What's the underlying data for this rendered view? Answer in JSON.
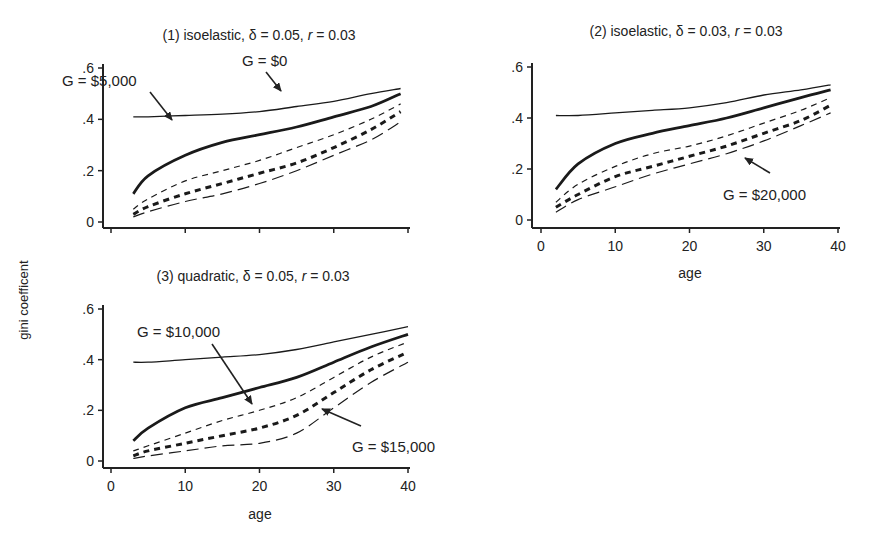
{
  "figure": {
    "y_axis_label": "gini coefficent",
    "x_axis_label": "age",
    "caption": ""
  },
  "chart_data": [
    {
      "type": "line",
      "panel": 1,
      "title": "(1) isoelastic, δ = 0.05, r = 0.03",
      "title_parts": {
        "prefix": "(1) isoelastic, δ = 0.05, ",
        "r": "r",
        "suffix": " = 0.03"
      },
      "xlabel": "",
      "ylabel": "gini coefficent",
      "xlim": [
        0,
        40
      ],
      "ylim": [
        0,
        0.6
      ],
      "x_ticks": [
        0,
        10,
        20,
        30,
        40
      ],
      "x_tick_labels_visible": false,
      "y_ticks": [
        0,
        0.2,
        0.4,
        0.6
      ],
      "y_tick_labels": [
        "0",
        ".2",
        ".4",
        ".6"
      ],
      "grid": false,
      "x": [
        3,
        5,
        10,
        15,
        20,
        25,
        30,
        35,
        39
      ],
      "series": [
        {
          "name": "G = $0",
          "style": "thin-solid",
          "values": [
            0.41,
            0.41,
            0.415,
            0.42,
            0.43,
            0.45,
            0.47,
            0.5,
            0.52
          ]
        },
        {
          "name": "G = $5,000",
          "style": "thick-solid",
          "values": [
            0.11,
            0.18,
            0.26,
            0.31,
            0.34,
            0.37,
            0.41,
            0.45,
            0.5
          ]
        },
        {
          "name": "G = $10,000",
          "style": "thin-dash",
          "values": [
            0.05,
            0.09,
            0.16,
            0.2,
            0.24,
            0.29,
            0.34,
            0.4,
            0.46
          ]
        },
        {
          "name": "G = $15,000",
          "style": "thick-dash",
          "values": [
            0.03,
            0.06,
            0.11,
            0.15,
            0.19,
            0.23,
            0.29,
            0.36,
            0.43
          ]
        },
        {
          "name": "G = $20,000",
          "style": "long-dash",
          "values": [
            0.02,
            0.04,
            0.08,
            0.11,
            0.15,
            0.2,
            0.26,
            0.32,
            0.39
          ]
        }
      ],
      "annotations": [
        {
          "text": "G = $5,000",
          "tx": 62,
          "ty": 86,
          "arrow_from": [
            150,
            92
          ],
          "arrow_to": [
            172,
            120
          ]
        },
        {
          "text": "G = $0",
          "tx": 242,
          "ty": 66,
          "arrow_from": [
            266,
            72
          ],
          "arrow_to": [
            281,
            91
          ]
        }
      ]
    },
    {
      "type": "line",
      "panel": 2,
      "title": "(2) isoelastic, δ = 0.03, r = 0.03",
      "title_parts": {
        "prefix": "(2) isoelastic, δ = 0.03, ",
        "r": "r",
        "suffix": " = 0.03"
      },
      "xlabel": "age",
      "ylabel": "",
      "xlim": [
        0,
        40
      ],
      "ylim": [
        0,
        0.6
      ],
      "x_ticks": [
        0,
        10,
        20,
        30,
        40
      ],
      "x_tick_labels_visible": true,
      "x_tick_labels": [
        "0",
        "10",
        "20",
        "30",
        "40"
      ],
      "y_ticks": [
        0,
        0.2,
        0.4,
        0.6
      ],
      "y_tick_labels": [
        "0",
        ".2",
        ".4",
        ".6"
      ],
      "grid": false,
      "x": [
        2,
        5,
        10,
        15,
        20,
        25,
        30,
        35,
        39
      ],
      "series": [
        {
          "name": "G = $0",
          "style": "thin-solid",
          "values": [
            0.41,
            0.41,
            0.42,
            0.43,
            0.44,
            0.46,
            0.49,
            0.51,
            0.53
          ]
        },
        {
          "name": "G = $5,000",
          "style": "thick-solid",
          "values": [
            0.12,
            0.22,
            0.3,
            0.34,
            0.37,
            0.4,
            0.44,
            0.48,
            0.51
          ]
        },
        {
          "name": "G = $10,000",
          "style": "thin-dash",
          "values": [
            0.07,
            0.14,
            0.21,
            0.26,
            0.29,
            0.33,
            0.38,
            0.43,
            0.48
          ]
        },
        {
          "name": "G = $15,000",
          "style": "thick-dash",
          "values": [
            0.05,
            0.1,
            0.17,
            0.21,
            0.25,
            0.29,
            0.34,
            0.39,
            0.45
          ]
        },
        {
          "name": "G = $20,000",
          "style": "long-dash",
          "values": [
            0.03,
            0.08,
            0.13,
            0.18,
            0.22,
            0.26,
            0.31,
            0.37,
            0.42
          ]
        }
      ],
      "annotations": [
        {
          "text": "G = $20,000",
          "tx": 723,
          "ty": 200,
          "arrow_from": [
            770,
            173
          ],
          "arrow_to": [
            745,
            158
          ]
        }
      ]
    },
    {
      "type": "line",
      "panel": 3,
      "title": "(3) quadratic, δ = 0.05, r = 0.03",
      "title_parts": {
        "prefix": "(3) quadratic, δ = 0.05, ",
        "r": "r",
        "suffix": " = 0.03"
      },
      "xlabel": "age",
      "ylabel": "",
      "xlim": [
        0,
        40
      ],
      "ylim": [
        0,
        0.6
      ],
      "x_ticks": [
        0,
        10,
        20,
        30,
        40
      ],
      "x_tick_labels_visible": true,
      "x_tick_labels": [
        "0",
        "10",
        "20",
        "30",
        "40"
      ],
      "y_ticks": [
        0,
        0.2,
        0.4,
        0.6
      ],
      "y_tick_labels": [
        "0",
        ".2",
        ".4",
        ".6"
      ],
      "grid": false,
      "x": [
        3,
        5,
        10,
        15,
        20,
        25,
        30,
        35,
        40
      ],
      "series": [
        {
          "name": "G = $0",
          "style": "thin-solid",
          "values": [
            0.39,
            0.39,
            0.4,
            0.41,
            0.42,
            0.44,
            0.47,
            0.5,
            0.53
          ]
        },
        {
          "name": "G = $5,000",
          "style": "thick-solid",
          "values": [
            0.08,
            0.13,
            0.21,
            0.25,
            0.29,
            0.33,
            0.39,
            0.45,
            0.5
          ]
        },
        {
          "name": "G = $10,000",
          "style": "thin-dash",
          "values": [
            0.04,
            0.06,
            0.11,
            0.16,
            0.2,
            0.25,
            0.33,
            0.41,
            0.47
          ]
        },
        {
          "name": "G = $15,000",
          "style": "thick-dash",
          "values": [
            0.02,
            0.04,
            0.07,
            0.1,
            0.13,
            0.18,
            0.27,
            0.36,
            0.43
          ]
        },
        {
          "name": "G = $20,000",
          "style": "long-dash",
          "values": [
            0.01,
            0.02,
            0.04,
            0.06,
            0.07,
            0.11,
            0.21,
            0.31,
            0.39
          ]
        }
      ],
      "annotations": [
        {
          "text": "G = $10,000",
          "tx": 137,
          "ty": 337,
          "arrow_from": [
            212,
            344
          ],
          "arrow_to": [
            252,
            404
          ]
        },
        {
          "text": "G = $15,000",
          "tx": 352,
          "ty": 452,
          "arrow_from": [
            361,
            426
          ],
          "arrow_to": [
            322,
            409
          ]
        }
      ]
    }
  ]
}
